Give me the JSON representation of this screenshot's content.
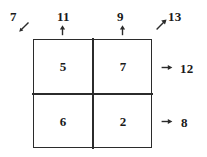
{
  "diagram": {
    "ink_color": "#2b2b2b",
    "background_color": "#ffffff",
    "grid": {
      "rows": 2,
      "cols": 2,
      "cells": [
        [
          {
            "value": "5"
          },
          {
            "value": "7"
          }
        ],
        [
          {
            "value": "6"
          },
          {
            "value": "2"
          }
        ]
      ]
    },
    "annotations": {
      "diagonal_top_left": {
        "value": "7",
        "arrow": "arrow-southwest-icon"
      },
      "column_sums": [
        {
          "value": "11",
          "arrow": "arrow-up-icon"
        },
        {
          "value": "9",
          "arrow": "arrow-up-icon"
        }
      ],
      "diagonal_top_right": {
        "value": "13",
        "arrow": "arrow-northeast-icon"
      },
      "row_sums": [
        {
          "value": "12",
          "arrow": "arrow-right-icon"
        },
        {
          "value": "8",
          "arrow": "arrow-right-icon"
        }
      ]
    }
  }
}
